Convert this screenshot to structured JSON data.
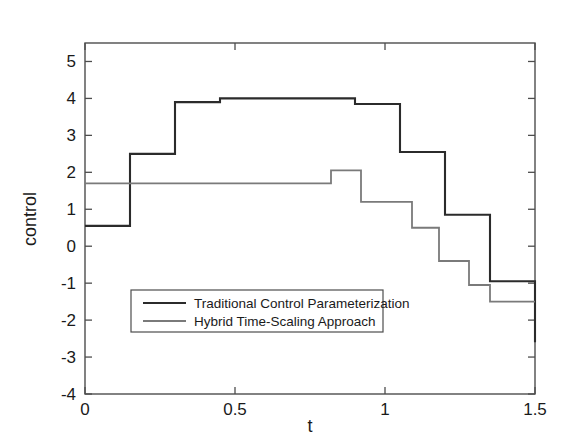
{
  "chart_data": {
    "type": "line",
    "title": "",
    "xlabel": "t",
    "ylabel": "control",
    "xlim": [
      0,
      1.5
    ],
    "ylim": [
      -4,
      5.5
    ],
    "grid": false,
    "legend_position": "lower-left-inside",
    "xticks": [
      0,
      0.5,
      1,
      1.5
    ],
    "xticklabels": [
      "0",
      "0.5",
      "1",
      "1.5"
    ],
    "yticks": [
      -4,
      -3,
      -2,
      -1,
      0,
      1,
      2,
      3,
      4,
      5
    ],
    "yticklabels": [
      "-4",
      "-3",
      "-2",
      "-1",
      "0",
      "1",
      "2",
      "3",
      "4",
      "5"
    ],
    "series": [
      {
        "name": "Traditional Control Parameterization",
        "color": "#2b2b2b",
        "style": "step-post",
        "breakpoints": [
          0.0,
          0.15,
          0.3,
          0.45,
          0.6,
          0.75,
          0.9,
          1.05,
          1.2,
          1.35,
          1.5
        ],
        "values": [
          0.55,
          2.5,
          3.9,
          4.0,
          4.0,
          4.0,
          3.85,
          2.55,
          0.85,
          -0.95,
          -2.6
        ]
      },
      {
        "name": "Hybrid Time-Scaling Approach",
        "color": "#7a7a7a",
        "style": "step-post",
        "breakpoints": [
          0.0,
          0.82,
          0.92,
          1.09,
          1.18,
          1.28,
          1.35,
          1.5
        ],
        "values": [
          1.7,
          2.05,
          1.2,
          0.5,
          -0.4,
          -1.05,
          -1.5
        ]
      }
    ]
  },
  "legend": {
    "entries": [
      {
        "label": "Traditional Control Parameterization",
        "color": "#2b2b2b"
      },
      {
        "label": "Hybrid Time-Scaling Approach",
        "color": "#7a7a7a"
      }
    ]
  },
  "axes": {
    "x_label": "t",
    "y_label": "control"
  }
}
